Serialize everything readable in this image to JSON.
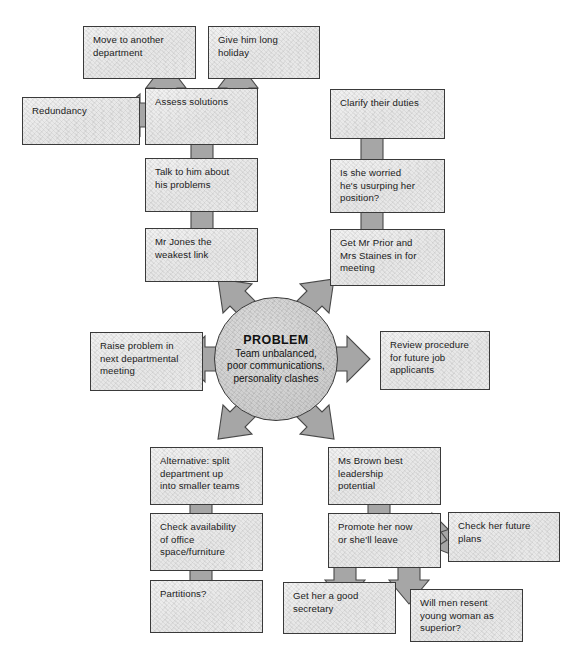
{
  "diagram": {
    "palette": {
      "box_fill": "#eeeeee",
      "box_border": "#3a3a3a",
      "arrow_fill": "#a6a6a6",
      "arrow_border": "#494949",
      "circle_fill": "#cfcfcf",
      "text": "#1b1b1b",
      "background": "#ffffff"
    },
    "center": {
      "title": "PROBLEM",
      "body": "Team unbalanced,\npoor communications,\npersonality clashes"
    },
    "nodes": [
      {
        "id": "move-to-another-department",
        "label": "Move to another\ndepartment"
      },
      {
        "id": "give-him-long-holiday",
        "label": "Give him long\nholiday"
      },
      {
        "id": "redundancy",
        "label": "Redundancy"
      },
      {
        "id": "assess-solutions",
        "label": "Assess solutions"
      },
      {
        "id": "clarify-their-duties",
        "label": "Clarify their duties"
      },
      {
        "id": "talk-to-him-about-his-problems",
        "label": "Talk to him about\nhis problems"
      },
      {
        "id": "is-she-worried",
        "label": "Is she worried\nhe's usurping her\nposition?"
      },
      {
        "id": "mr-jones-the-weakest-link",
        "label": "Mr Jones the\nweakest link"
      },
      {
        "id": "get-mr-prior-and-mrs-staines",
        "label": "Get Mr Prior and\nMrs Staines in for\nmeeting"
      },
      {
        "id": "raise-problem-in-next-departmental-meeting",
        "label": "Raise problem in\nnext departmental\nmeeting"
      },
      {
        "id": "review-procedure-for-future-job-applicants",
        "label": "Review procedure\nfor future job\napplicants"
      },
      {
        "id": "alternative-split-department-up",
        "label": "Alternative: split\ndepartment up\ninto smaller teams"
      },
      {
        "id": "ms-brown-best-leadership-potential",
        "label": "Ms Brown best\nleadership\npotential"
      },
      {
        "id": "check-availability-of-office-space",
        "label": "Check availability\nof office\nspace/furniture"
      },
      {
        "id": "promote-her-now-or-shell-leave",
        "label": "Promote her now\nor she'll leave"
      },
      {
        "id": "check-her-future-plans",
        "label": "Check her future\nplans"
      },
      {
        "id": "partitions",
        "label": "Partitions?"
      },
      {
        "id": "get-her-a-good-secretary",
        "label": "Get her a good\nsecretary"
      },
      {
        "id": "will-men-resent-young-woman",
        "label": "Will men resent\nyoung woman as\nsuperior?"
      }
    ],
    "connections": [
      {
        "from": "problem",
        "to": "talk-to-him-about-his-problems",
        "direction": "up-left"
      },
      {
        "from": "problem",
        "to": "get-mr-prior-and-mrs-staines",
        "direction": "up-right"
      },
      {
        "from": "problem",
        "to": "raise-problem-in-next-departmental-meeting",
        "direction": "left"
      },
      {
        "from": "problem",
        "to": "review-procedure-for-future-job-applicants",
        "direction": "right"
      },
      {
        "from": "problem",
        "to": "alternative-split-department-up",
        "direction": "down-left"
      },
      {
        "from": "problem",
        "to": "ms-brown-best-leadership-potential",
        "direction": "down-right"
      },
      {
        "from": "mr-jones-the-weakest-link",
        "to": "talk-to-him-about-his-problems",
        "direction": "up"
      },
      {
        "from": "talk-to-him-about-his-problems",
        "to": "assess-solutions",
        "direction": "up"
      },
      {
        "from": "assess-solutions",
        "to": "move-to-another-department",
        "direction": "up"
      },
      {
        "from": "assess-solutions",
        "to": "give-him-long-holiday",
        "direction": "up"
      },
      {
        "from": "assess-solutions",
        "to": "redundancy",
        "direction": "left"
      },
      {
        "from": "get-mr-prior-and-mrs-staines",
        "to": "is-she-worried",
        "direction": "up"
      },
      {
        "from": "is-she-worried",
        "to": "clarify-their-duties",
        "direction": "up"
      },
      {
        "from": "alternative-split-department-up",
        "to": "check-availability-of-office-space",
        "direction": "down"
      },
      {
        "from": "check-availability-of-office-space",
        "to": "partitions",
        "direction": "down"
      },
      {
        "from": "ms-brown-best-leadership-potential",
        "to": "promote-her-now-or-shell-leave",
        "direction": "down"
      },
      {
        "from": "promote-her-now-or-shell-leave",
        "to": "check-her-future-plans",
        "direction": "right"
      },
      {
        "from": "promote-her-now-or-shell-leave",
        "to": "get-her-a-good-secretary",
        "direction": "down"
      },
      {
        "from": "promote-her-now-or-shell-leave",
        "to": "will-men-resent-young-woman",
        "direction": "down-right"
      }
    ]
  }
}
